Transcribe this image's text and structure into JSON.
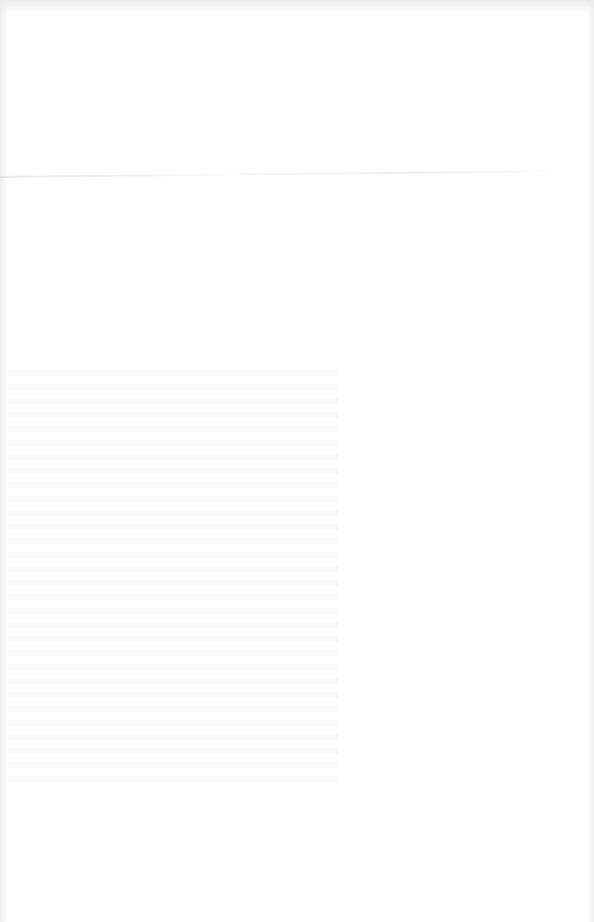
{
  "document": {
    "type": "scanned-blank-page",
    "footer_stamp": {
      "line1": "",
      "line2": ""
    }
  }
}
